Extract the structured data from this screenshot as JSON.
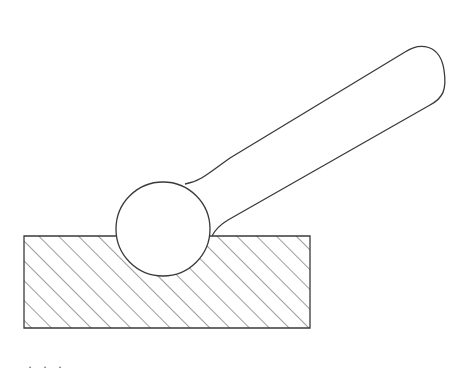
{
  "diagram": {
    "components": [
      {
        "id": "block",
        "label": "hatched block (cross-section)",
        "hatch": "diagonal 45deg"
      },
      {
        "id": "ball",
        "label": "spherical ball end"
      },
      {
        "id": "handle",
        "label": "tapered handle with rounded end"
      }
    ],
    "colors": {
      "stroke": "#3a3a3a",
      "hatch": "#4a4a4a",
      "background": "#ffffff"
    },
    "caption_fragment": "· · ·"
  }
}
